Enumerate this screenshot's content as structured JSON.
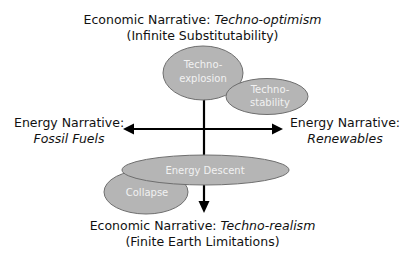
{
  "top": {
    "prefix": "Economic Narrative: ",
    "emphasis": "Techno-optimism",
    "subtitle": "(Infinite Substitutability)"
  },
  "bottom": {
    "prefix": "Economic Narrative: ",
    "emphasis": "Techno-realism",
    "subtitle": "(Finite Earth Limitations)"
  },
  "left": {
    "title": "Energy Narrative:",
    "emphasis": "Fossil Fuels"
  },
  "right": {
    "title": "Energy Narrative:",
    "emphasis": "Renewables"
  },
  "scenarios": {
    "techno_explosion": {
      "line1": "Techno-",
      "line2": "explosion"
    },
    "techno_stability": {
      "line1": "Techno-",
      "line2": "stability"
    },
    "energy_descent": {
      "label": "Energy Descent"
    },
    "collapse": {
      "label": "Collapse"
    }
  },
  "colors": {
    "ellipse_fill": "#b5b5b5",
    "ellipse_stroke": "#6e6e6e",
    "axis": "#000000",
    "ellipse_text": "#f2f2f2"
  }
}
